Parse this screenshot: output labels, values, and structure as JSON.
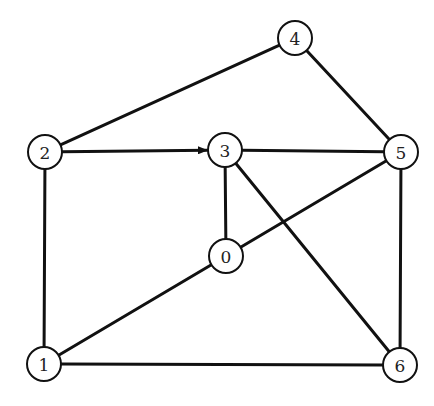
{
  "diagram": {
    "type": "graph",
    "node_radius": 17,
    "colors": {
      "stroke": "#111111",
      "fill": "#ffffff",
      "label": "#222222"
    },
    "nodes": [
      {
        "id": "0",
        "label": "0",
        "x": 226,
        "y": 256
      },
      {
        "id": "1",
        "label": "1",
        "x": 44,
        "y": 364
      },
      {
        "id": "2",
        "label": "2",
        "x": 45,
        "y": 152
      },
      {
        "id": "3",
        "label": "3",
        "x": 225,
        "y": 150
      },
      {
        "id": "4",
        "label": "4",
        "x": 295,
        "y": 38
      },
      {
        "id": "5",
        "label": "5",
        "x": 401,
        "y": 152
      },
      {
        "id": "6",
        "label": "6",
        "x": 400,
        "y": 365
      }
    ],
    "edges": [
      {
        "from": "2",
        "to": "4",
        "directed": false
      },
      {
        "from": "2",
        "to": "3",
        "directed": true
      },
      {
        "from": "2",
        "to": "1",
        "directed": false
      },
      {
        "from": "4",
        "to": "5",
        "directed": false
      },
      {
        "from": "3",
        "to": "5",
        "directed": false
      },
      {
        "from": "3",
        "to": "0",
        "directed": false
      },
      {
        "from": "3",
        "to": "6",
        "directed": false
      },
      {
        "from": "0",
        "to": "5",
        "directed": false
      },
      {
        "from": "0",
        "to": "1",
        "directed": false
      },
      {
        "from": "5",
        "to": "6",
        "directed": false
      },
      {
        "from": "1",
        "to": "6",
        "directed": false
      }
    ]
  }
}
